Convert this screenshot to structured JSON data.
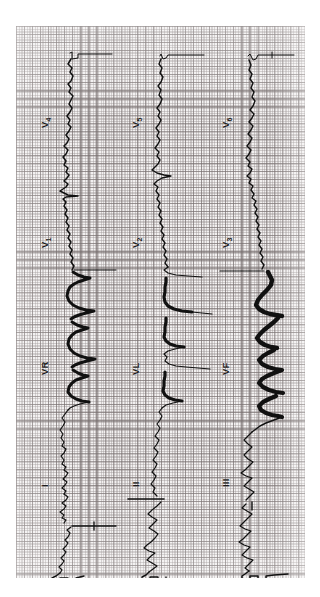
{
  "document": {
    "kind": "12-lead-ecg-strip",
    "orientation": "rotated-90",
    "paper_color": "#f2f0f0",
    "grid_minor_color": "#968f8f",
    "grid_major_color": "#787070",
    "trace_color": "#111111",
    "page_background": "#ffffff"
  },
  "leads": [
    {
      "id": "V4",
      "label": "V",
      "sub": "4",
      "column": 1,
      "half": "top",
      "label_x": 40,
      "label_y": 128
    },
    {
      "id": "V1",
      "label": "V",
      "sub": "1",
      "column": 1,
      "half": "top",
      "label_x": 40,
      "label_y": 248
    },
    {
      "id": "V5",
      "label": "V",
      "sub": "5",
      "column": 2,
      "half": "top",
      "label_x": 131,
      "label_y": 128
    },
    {
      "id": "V2",
      "label": "V",
      "sub": "2",
      "column": 2,
      "half": "top",
      "label_x": 131,
      "label_y": 248
    },
    {
      "id": "V6",
      "label": "V",
      "sub": "6",
      "column": 3,
      "half": "top",
      "label_x": 221,
      "label_y": 128
    },
    {
      "id": "V3",
      "label": "V",
      "sub": "3",
      "column": 3,
      "half": "top",
      "label_x": 221,
      "label_y": 248
    },
    {
      "id": "VR",
      "label": "VR",
      "sub": "",
      "column": 1,
      "half": "bottom",
      "label_x": 40,
      "label_y": 375
    },
    {
      "id": "I",
      "label": "I",
      "sub": "",
      "column": 1,
      "half": "bottom",
      "label_x": 40,
      "label_y": 487
    },
    {
      "id": "VL",
      "label": "VL",
      "sub": "",
      "column": 2,
      "half": "bottom",
      "label_x": 131,
      "label_y": 375
    },
    {
      "id": "II",
      "label": "II",
      "sub": "",
      "column": 2,
      "half": "bottom",
      "label_x": 131,
      "label_y": 487
    },
    {
      "id": "VF",
      "label": "VF",
      "sub": "",
      "column": 3,
      "half": "bottom",
      "label_x": 221,
      "label_y": 375
    },
    {
      "id": "III",
      "label": "III",
      "sub": "",
      "column": 3,
      "half": "bottom",
      "label_x": 221,
      "label_y": 487
    }
  ],
  "chart_data": {
    "type": "line",
    "xlabel": "time",
    "ylabel": "voltage",
    "grid": true,
    "legend": "none",
    "note": "Traces run vertically (page rotated 90 deg). Each column holds two stacked leads; calibration pulses appear at the strip ends.",
    "columns": [
      {
        "baseline_x": 54,
        "leads": [
          "V4",
          "V1",
          "VR",
          "I"
        ]
      },
      {
        "baseline_x": 146,
        "leads": [
          "V5",
          "V2",
          "VL",
          "II"
        ]
      },
      {
        "baseline_x": 236,
        "leads": [
          "V6",
          "V3",
          "VF",
          "III"
        ]
      }
    ],
    "series": [
      {
        "name": "V4",
        "amplitude": "medium",
        "qrs_weight": "thin"
      },
      {
        "name": "V1",
        "amplitude": "large",
        "qrs_weight": "thick"
      },
      {
        "name": "V5",
        "amplitude": "medium",
        "qrs_weight": "thin"
      },
      {
        "name": "V2",
        "amplitude": "large",
        "qrs_weight": "thick"
      },
      {
        "name": "V6",
        "amplitude": "medium",
        "qrs_weight": "thin"
      },
      {
        "name": "V3",
        "amplitude": "very-large",
        "qrs_weight": "very-thick"
      },
      {
        "name": "VR",
        "amplitude": "small",
        "qrs_weight": "thin"
      },
      {
        "name": "I",
        "amplitude": "small",
        "qrs_weight": "thin"
      },
      {
        "name": "VL",
        "amplitude": "small",
        "qrs_weight": "thin"
      },
      {
        "name": "II",
        "amplitude": "medium",
        "qrs_weight": "thin"
      },
      {
        "name": "VF",
        "amplitude": "medium",
        "qrs_weight": "thin"
      },
      {
        "name": "III",
        "amplitude": "medium",
        "qrs_weight": "thin"
      }
    ]
  }
}
